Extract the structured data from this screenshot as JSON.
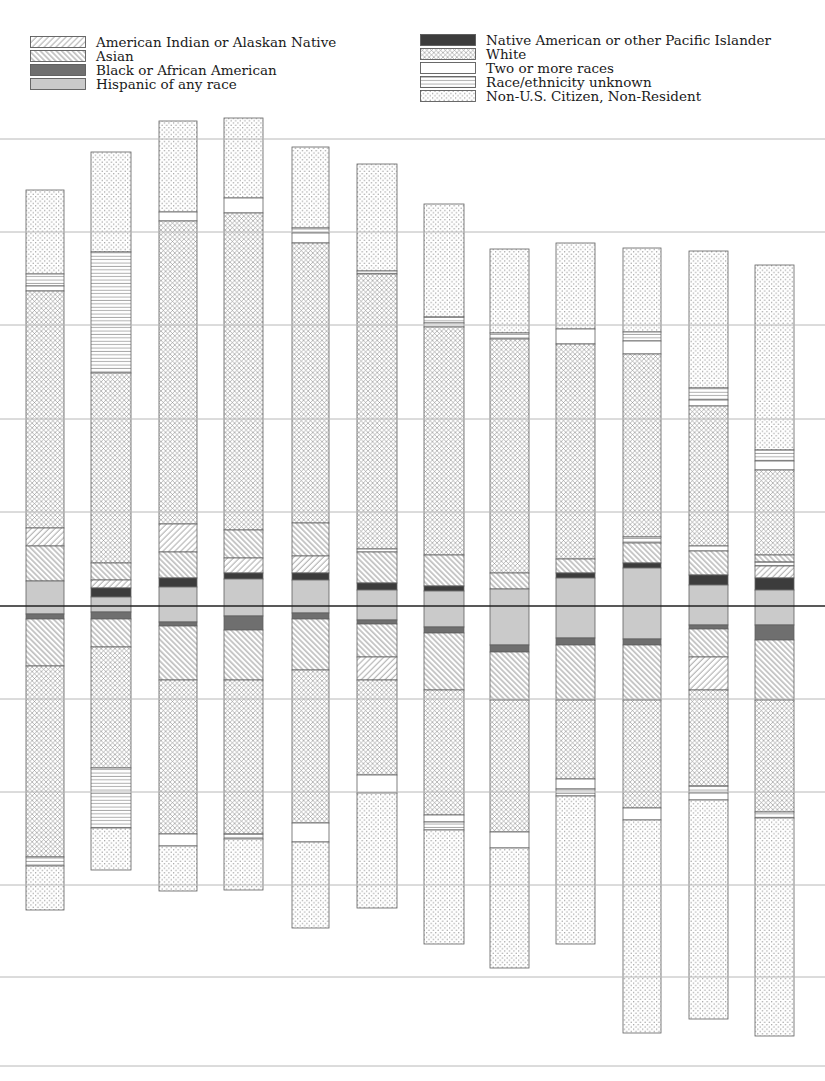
{
  "page": {
    "background": "#ffffff"
  },
  "legend": {
    "left_keys": [
      "amind",
      "asian",
      "black",
      "hispanic"
    ],
    "right_keys": [
      "nhpi",
      "white",
      "two",
      "unknown",
      "nonres"
    ],
    "categories": {
      "amind": {
        "label": "American Indian or Alaskan Native",
        "swatch": {
          "type": "hatch-up",
          "color": "#9b9b9b"
        }
      },
      "asian": {
        "label": "Asian",
        "swatch": {
          "type": "hatch-down",
          "color": "#808080"
        }
      },
      "black": {
        "label": "Black or African American",
        "swatch": {
          "type": "solid",
          "color": "#6f6f6f"
        }
      },
      "hispanic": {
        "label": "Hispanic of any race",
        "swatch": {
          "type": "solid",
          "color": "#cacaca"
        }
      },
      "nhpi": {
        "label": "Native American or other Pacific Islander",
        "swatch": {
          "type": "solid",
          "color": "#3c3c3c"
        }
      },
      "white": {
        "label": "White",
        "swatch": {
          "type": "cross",
          "color": "#8c8c8c"
        }
      },
      "two": {
        "label": "Two or more races",
        "swatch": {
          "type": "solid",
          "color": "#ffffff"
        }
      },
      "unknown": {
        "label": "Race/ethnicity unknown",
        "swatch": {
          "type": "hlines",
          "color": "#909090"
        }
      },
      "nonres": {
        "label": "Non-U.S. Citizen, Non-Resident",
        "swatch": {
          "type": "dots",
          "color": "#8c8c8c"
        }
      }
    }
  },
  "chart_data": {
    "type": "bar",
    "variant": "mirrored stacked bars with pattern fills, centered on a dark axis line; no axis tick labels visible",
    "title": "",
    "xlabel": "",
    "ylabel": "",
    "axis": {
      "centerline_y": 606,
      "centerline_color": "#222222",
      "gridlines_y": [
        139,
        232,
        325,
        419,
        512,
        699,
        792,
        885,
        977,
        1066
      ],
      "grid_color": "#b8b8b8",
      "grid_on": true
    },
    "bar_border_color": "#606060",
    "bars": [
      {
        "x": 26,
        "w": 38,
        "segments": [
          [
            "nonres",
            190,
            274
          ],
          [
            "unknown",
            274,
            286
          ],
          [
            "two",
            286,
            291
          ],
          [
            "white",
            291,
            528
          ],
          [
            "amind",
            528,
            546
          ],
          [
            "asian",
            546,
            581
          ],
          [
            "hispanic",
            581,
            614
          ],
          [
            "black",
            614,
            619
          ],
          [
            "asian",
            619,
            666
          ],
          [
            "white",
            666,
            857
          ],
          [
            "unknown",
            857,
            866
          ],
          [
            "nonres",
            866,
            910
          ]
        ]
      },
      {
        "x": 91,
        "w": 40,
        "segments": [
          [
            "nonres",
            152,
            252
          ],
          [
            "unknown",
            252,
            373
          ],
          [
            "white",
            373,
            563
          ],
          [
            "asian",
            563,
            580
          ],
          [
            "amind",
            580,
            588
          ],
          [
            "nhpi",
            588,
            597
          ],
          [
            "hispanic",
            597,
            612
          ],
          [
            "black",
            612,
            619
          ],
          [
            "asian",
            619,
            647
          ],
          [
            "white",
            647,
            768
          ],
          [
            "unknown",
            768,
            828
          ],
          [
            "nonres",
            828,
            870
          ]
        ]
      },
      {
        "x": 159,
        "w": 38,
        "segments": [
          [
            "nonres",
            121,
            212
          ],
          [
            "two",
            212,
            221
          ],
          [
            "white",
            221,
            524
          ],
          [
            "amind",
            524,
            552
          ],
          [
            "asian",
            552,
            578
          ],
          [
            "nhpi",
            578,
            587
          ],
          [
            "hispanic",
            587,
            622
          ],
          [
            "black",
            622,
            626
          ],
          [
            "asian",
            626,
            680
          ],
          [
            "white",
            680,
            834
          ],
          [
            "two",
            834,
            846
          ],
          [
            "nonres",
            846,
            891
          ]
        ]
      },
      {
        "x": 224,
        "w": 39,
        "segments": [
          [
            "nonres",
            118,
            198
          ],
          [
            "two",
            198,
            213
          ],
          [
            "white",
            213,
            530
          ],
          [
            "asian",
            530,
            558
          ],
          [
            "amind",
            558,
            573
          ],
          [
            "nhpi",
            573,
            579
          ],
          [
            "hispanic",
            579,
            616
          ],
          [
            "black",
            616,
            630
          ],
          [
            "asian",
            630,
            680
          ],
          [
            "white",
            680,
            834
          ],
          [
            "unknown",
            834,
            839
          ],
          [
            "nonres",
            839,
            890
          ]
        ]
      },
      {
        "x": 292,
        "w": 37,
        "segments": [
          [
            "nonres",
            147,
            228
          ],
          [
            "unknown",
            228,
            233
          ],
          [
            "two",
            233,
            243
          ],
          [
            "white",
            243,
            523
          ],
          [
            "asian",
            523,
            556
          ],
          [
            "amind",
            556,
            573
          ],
          [
            "nhpi",
            573,
            580
          ],
          [
            "hispanic",
            580,
            613
          ],
          [
            "black",
            613,
            619
          ],
          [
            "asian",
            619,
            670
          ],
          [
            "white",
            670,
            823
          ],
          [
            "two",
            823,
            842
          ],
          [
            "nonres",
            842,
            928
          ]
        ]
      },
      {
        "x": 357,
        "w": 40,
        "segments": [
          [
            "nonres",
            164,
            271
          ],
          [
            "unknown",
            271,
            274
          ],
          [
            "white",
            274,
            549
          ],
          [
            "two",
            549,
            552
          ],
          [
            "asian",
            552,
            583
          ],
          [
            "nhpi",
            583,
            590
          ],
          [
            "hispanic",
            590,
            620
          ],
          [
            "black",
            620,
            624
          ],
          [
            "asian",
            624,
            657
          ],
          [
            "amind",
            657,
            680
          ],
          [
            "white",
            680,
            775
          ],
          [
            "two",
            775,
            793
          ],
          [
            "nonres",
            793,
            908
          ]
        ]
      },
      {
        "x": 424,
        "w": 40,
        "segments": [
          [
            "nonres",
            204,
            317
          ],
          [
            "unknown",
            317,
            323
          ],
          [
            "two",
            323,
            327
          ],
          [
            "white",
            327,
            555
          ],
          [
            "asian",
            555,
            586
          ],
          [
            "nhpi",
            586,
            591
          ],
          [
            "hispanic",
            591,
            627
          ],
          [
            "black",
            627,
            633
          ],
          [
            "asian",
            633,
            690
          ],
          [
            "white",
            690,
            815
          ],
          [
            "two",
            815,
            822
          ],
          [
            "unknown",
            822,
            830
          ],
          [
            "nonres",
            830,
            944
          ]
        ]
      },
      {
        "x": 490,
        "w": 39,
        "segments": [
          [
            "nonres",
            249,
            333
          ],
          [
            "unknown",
            333,
            339
          ],
          [
            "white",
            339,
            573
          ],
          [
            "asian",
            573,
            589
          ],
          [
            "hispanic",
            589,
            645
          ],
          [
            "black",
            645,
            652
          ],
          [
            "asian",
            652,
            700
          ],
          [
            "white",
            700,
            832
          ],
          [
            "two",
            832,
            848
          ],
          [
            "nonres",
            848,
            968
          ]
        ]
      },
      {
        "x": 556,
        "w": 39,
        "segments": [
          [
            "nonres",
            243,
            329
          ],
          [
            "two",
            329,
            344
          ],
          [
            "white",
            344,
            559
          ],
          [
            "asian",
            559,
            573
          ],
          [
            "nhpi",
            573,
            578
          ],
          [
            "hispanic",
            578,
            638
          ],
          [
            "black",
            638,
            645
          ],
          [
            "asian",
            645,
            700
          ],
          [
            "white",
            700,
            779
          ],
          [
            "two",
            779,
            789
          ],
          [
            "unknown",
            789,
            796
          ],
          [
            "nonres",
            796,
            944
          ]
        ]
      },
      {
        "x": 623,
        "w": 38,
        "segments": [
          [
            "nonres",
            248,
            332
          ],
          [
            "unknown",
            332,
            341
          ],
          [
            "two",
            341,
            354
          ],
          [
            "white",
            354,
            537
          ],
          [
            "unknown",
            537,
            543
          ],
          [
            "asian",
            543,
            563
          ],
          [
            "nhpi",
            563,
            568
          ],
          [
            "hispanic",
            568,
            639
          ],
          [
            "black",
            639,
            645
          ],
          [
            "asian",
            645,
            700
          ],
          [
            "white",
            700,
            808
          ],
          [
            "two",
            808,
            820
          ],
          [
            "nonres",
            820,
            1033
          ]
        ]
      },
      {
        "x": 689,
        "w": 39,
        "segments": [
          [
            "nonres",
            251,
            388
          ],
          [
            "unknown",
            388,
            400
          ],
          [
            "two",
            400,
            406
          ],
          [
            "white",
            406,
            546
          ],
          [
            "two",
            546,
            551
          ],
          [
            "asian",
            551,
            575
          ],
          [
            "nhpi",
            575,
            585
          ],
          [
            "hispanic",
            585,
            625
          ],
          [
            "black",
            625,
            629
          ],
          [
            "asian",
            629,
            657
          ],
          [
            "amind",
            657,
            690
          ],
          [
            "white",
            690,
            786
          ],
          [
            "unknown",
            786,
            793
          ],
          [
            "two",
            793,
            800
          ],
          [
            "nonres",
            800,
            1019
          ]
        ]
      },
      {
        "x": 755,
        "w": 39,
        "segments": [
          [
            "nonres",
            265,
            450
          ],
          [
            "unknown",
            450,
            461
          ],
          [
            "two",
            461,
            470
          ],
          [
            "white",
            470,
            555
          ],
          [
            "asian",
            555,
            562
          ],
          [
            "unknown",
            562,
            566
          ],
          [
            "amind",
            566,
            578
          ],
          [
            "nhpi",
            578,
            590
          ],
          [
            "hispanic",
            590,
            625
          ],
          [
            "black",
            625,
            640
          ],
          [
            "asian",
            640,
            700
          ],
          [
            "white",
            700,
            812
          ],
          [
            "unknown",
            812,
            818
          ],
          [
            "nonres",
            818,
            1036
          ]
        ]
      }
    ]
  }
}
